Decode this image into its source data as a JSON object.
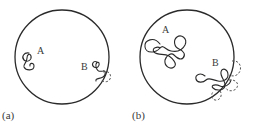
{
  "figure": {
    "panels": [
      {
        "id": "a",
        "label": "(a)",
        "chains": [
          {
            "name": "A",
            "label": "A",
            "position": "interior"
          },
          {
            "name": "B",
            "label": "B",
            "position": "at boundary, partially outside (dashed)"
          }
        ]
      },
      {
        "id": "b",
        "label": "(b)",
        "chains": [
          {
            "name": "A",
            "label": "A",
            "position": "interior"
          },
          {
            "name": "B",
            "label": "B",
            "position": "at boundary, partially outside (dashed)"
          }
        ]
      }
    ],
    "colors": {
      "stroke": "#2a2a2a",
      "text": "#3a3a3a",
      "background": "#ffffff"
    }
  }
}
